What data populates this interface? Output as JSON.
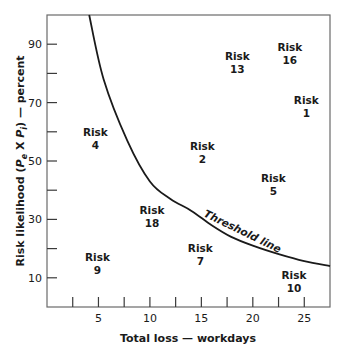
{
  "chart_data": {
    "type": "scatter",
    "title": "",
    "xlabel": "Total loss — workdays",
    "ylabel": "Risk likelihood (Pₑ × Pᵢ) — percent",
    "ylabel_parts": {
      "prefix": "Risk likelihood (",
      "p1": "P",
      "s1": "e",
      "x": " X ",
      "p2": "P",
      "s2": "i",
      "suffix": ") — percent"
    },
    "xlim": [
      0,
      27.5
    ],
    "ylim": [
      0,
      100
    ],
    "x_ticks_major": [
      5,
      10,
      15,
      20,
      25
    ],
    "x_ticks_minor": [
      2.5,
      7.5,
      12.5,
      17.5,
      22.5
    ],
    "y_ticks_major": [
      10,
      30,
      50,
      70,
      90
    ],
    "y_ticks_minor": [
      20,
      40,
      60,
      80
    ],
    "grid": false,
    "legend": null,
    "points": [
      {
        "label": "Risk",
        "id": "4",
        "x": 4.7,
        "y": 58
      },
      {
        "label": "Risk",
        "id": "2",
        "x": 15.1,
        "y": 53
      },
      {
        "label": "Risk",
        "id": "18",
        "x": 10.2,
        "y": 31
      },
      {
        "label": "Risk",
        "id": "9",
        "x": 4.9,
        "y": 15
      },
      {
        "label": "Risk",
        "id": "7",
        "x": 14.9,
        "y": 18
      },
      {
        "label": "Risk",
        "id": "13",
        "x": 18.5,
        "y": 84
      },
      {
        "label": "Risk",
        "id": "16",
        "x": 23.6,
        "y": 87
      },
      {
        "label": "Risk",
        "id": "1",
        "x": 25.2,
        "y": 69
      },
      {
        "label": "Risk",
        "id": "5",
        "x": 22.0,
        "y": 42
      },
      {
        "label": "Risk",
        "id": "10",
        "x": 24.0,
        "y": 9
      }
    ],
    "threshold_curve": {
      "label": "Threshold line",
      "points": [
        [
          4.1,
          100
        ],
        [
          5.5,
          78
        ],
        [
          7.8,
          57
        ],
        [
          10.0,
          43
        ],
        [
          12.0,
          37
        ],
        [
          14.0,
          33
        ],
        [
          16.0,
          28
        ],
        [
          17.9,
          24
        ],
        [
          20.0,
          21
        ],
        [
          22.6,
          18
        ],
        [
          25.0,
          15.7
        ],
        [
          27.5,
          14
        ]
      ]
    },
    "annotations": [
      "Threshold line"
    ]
  }
}
